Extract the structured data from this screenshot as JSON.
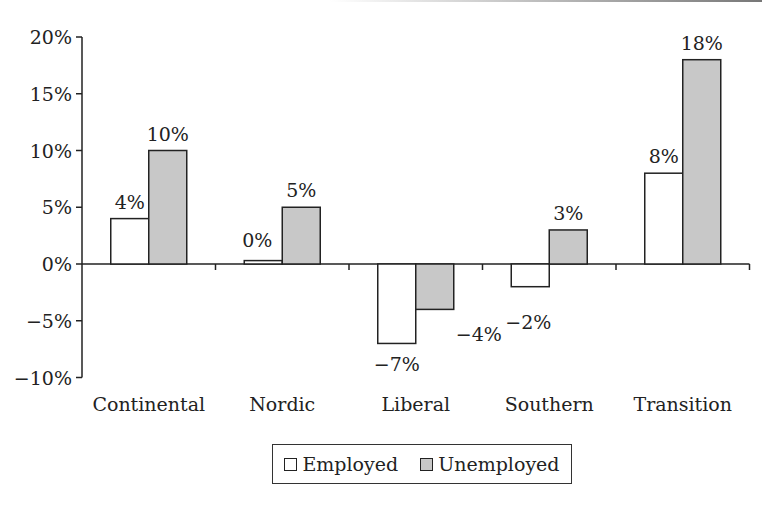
{
  "chart_data": {
    "type": "bar",
    "title": "",
    "xlabel": "",
    "ylabel": "",
    "categories": [
      "Continental",
      "Nordic",
      "Liberal",
      "Southern",
      "Transition"
    ],
    "series": [
      {
        "name": "Employed",
        "values": [
          4,
          0.3,
          -7,
          -2,
          8
        ],
        "labels": [
          "4%",
          "0%",
          "−7%",
          "−2%",
          "8%"
        ],
        "color": "#ffffff"
      },
      {
        "name": "Unemployed",
        "values": [
          10,
          5,
          -4,
          3,
          18
        ],
        "labels": [
          "10%",
          "5%",
          "−4%",
          "3%",
          "18%"
        ],
        "color": "#c8c8c8"
      }
    ],
    "yticks": [
      "20%",
      "15%",
      "10%",
      "5%",
      "0%",
      "−5%",
      "−10%"
    ],
    "ylim": [
      -10,
      20
    ],
    "grid": false,
    "legend_position": "bottom"
  },
  "legend": {
    "employed": "Employed",
    "unemployed": "Unemployed"
  }
}
